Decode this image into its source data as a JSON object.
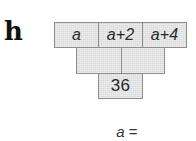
{
  "problem": {
    "label": "h",
    "pyramid": {
      "top_row": [
        {
          "text": "a",
          "italic": true
        },
        {
          "text": "a+2",
          "italic": true
        },
        {
          "text": "a+4",
          "italic": true
        }
      ],
      "middle_row": [
        {
          "text": ""
        },
        {
          "text": ""
        }
      ],
      "bottom_row": [
        {
          "text": "36"
        }
      ]
    },
    "answer_prompt": {
      "variable": "a",
      "operator": " ="
    }
  },
  "colors": {
    "cell_fill": "#e3e3e3",
    "cell_border": "#8e8e8e",
    "text": "#2a2a2a",
    "label": "#111111"
  }
}
